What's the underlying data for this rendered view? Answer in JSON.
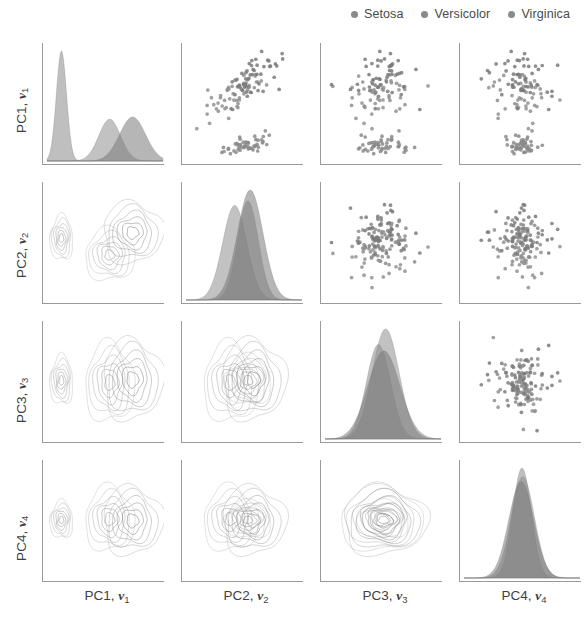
{
  "figure": {
    "type": "pair-plot",
    "title": "",
    "n_variables": 4,
    "background": "#ffffff",
    "spine_color": "#9a9a9a"
  },
  "legend": {
    "position": "top-right",
    "marker": "dot",
    "entries": [
      {
        "label": "Setosa",
        "color": "#8a8a8a"
      },
      {
        "label": "Versicolor",
        "color": "#8a8a8a"
      },
      {
        "label": "Virginica",
        "color": "#8a8a8a"
      }
    ]
  },
  "axes": {
    "variables": [
      {
        "id": "pc1",
        "prefix": "PC1,",
        "vector": "v",
        "subscript": "1"
      },
      {
        "id": "pc2",
        "prefix": "PC2,",
        "vector": "v",
        "subscript": "2"
      },
      {
        "id": "pc3",
        "prefix": "PC3,",
        "vector": "v",
        "subscript": "3"
      },
      {
        "id": "pc4",
        "prefix": "PC4,",
        "vector": "v",
        "subscript": "4"
      }
    ],
    "row_labels": [
      "PC1, v1",
      "PC2, v2",
      "PC3, v3",
      "PC4, v4"
    ],
    "col_labels": [
      "PC1, v1",
      "PC2, v2",
      "PC3, v3",
      "PC4, v4"
    ],
    "tick_labels_shown": false,
    "spines": [
      "left",
      "bottom"
    ]
  },
  "chart_data": {
    "type": "scatter",
    "title": "",
    "xlabel": "",
    "ylabel": "",
    "matrix": {
      "rows": [
        "PC1, v1",
        "PC2, v2",
        "PC3, v3",
        "PC4, v4"
      ],
      "cols": [
        "PC1, v1",
        "PC2, v2",
        "PC3, v3",
        "PC4, v4"
      ],
      "diagonal_plot": "filled-kde-density",
      "upper_triangle_plot": "scatter",
      "lower_triangle_plot": "kde-contour"
    },
    "groups": [
      {
        "name": "Setosa",
        "n": 50,
        "color": "#8a8a8a",
        "fill_opacity": 0.55
      },
      {
        "name": "Versicolor",
        "n": 50,
        "color": "#909090",
        "fill_opacity": 0.55
      },
      {
        "name": "Virginica",
        "n": 50,
        "color": "#7a7a7a",
        "fill_opacity": 0.55
      }
    ],
    "group_means": {
      "Setosa": {
        "pc1": -2.64,
        "pc2": 0.19,
        "pc3": 0.01,
        "pc4": 0.0
      },
      "Versicolor": {
        "pc1": 0.56,
        "pc2": -0.65,
        "pc3": -0.04,
        "pc4": 0.01
      },
      "Virginica": {
        "pc1": 2.08,
        "pc2": 0.46,
        "pc3": 0.03,
        "pc4": -0.01
      }
    },
    "group_sd": {
      "Setosa": {
        "pc1": 0.33,
        "pc2": 0.49,
        "pc3": 0.25,
        "pc4": 0.11
      },
      "Versicolor": {
        "pc1": 0.71,
        "pc2": 0.57,
        "pc3": 0.4,
        "pc4": 0.19
      },
      "Virginica": {
        "pc1": 0.86,
        "pc2": 0.67,
        "pc3": 0.41,
        "pc4": 0.2
      }
    },
    "axis_ranges": {
      "pc1": [
        -3.6,
        4.1
      ],
      "pc2": [
        -2.8,
        2.8
      ],
      "pc3": [
        -1.3,
        1.3
      ],
      "pc4": [
        -0.75,
        0.75
      ]
    },
    "density_peaks": {
      "pc1": [
        {
          "group": "Setosa",
          "center": -2.64,
          "height": 1.0,
          "width": 0.34
        },
        {
          "group": "Versicolor",
          "center": 0.56,
          "height": 0.38,
          "width": 0.72
        },
        {
          "group": "Virginica",
          "center": 2.08,
          "height": 0.4,
          "width": 0.86
        }
      ],
      "pc2": [
        {
          "group": "Setosa",
          "center": 0.19,
          "height": 0.9,
          "width": 0.5
        },
        {
          "group": "Versicolor",
          "center": -0.45,
          "height": 0.86,
          "width": 0.58
        },
        {
          "group": "Virginica",
          "center": 0.3,
          "height": 1.0,
          "width": 0.62
        }
      ],
      "pc3": [
        {
          "group": "Setosa",
          "center": -0.1,
          "height": 0.86,
          "width": 0.27
        },
        {
          "group": "Versicolor",
          "center": 0.06,
          "height": 1.0,
          "width": 0.3
        },
        {
          "group": "Virginica",
          "center": 0.02,
          "height": 0.8,
          "width": 0.36
        }
      ],
      "pc4": [
        {
          "group": "Setosa",
          "center": 0.0,
          "height": 1.0,
          "width": 0.12
        },
        {
          "group": "Versicolor",
          "center": 0.01,
          "height": 0.92,
          "width": 0.15
        },
        {
          "group": "Virginica",
          "center": -0.01,
          "height": 0.88,
          "width": 0.16
        }
      ]
    },
    "grid": false,
    "legend_position": "top-right"
  }
}
